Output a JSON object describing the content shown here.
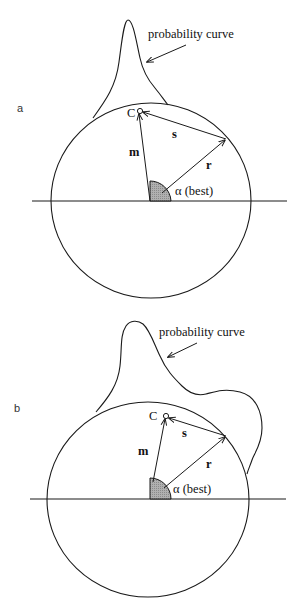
{
  "panels": [
    {
      "label": "a",
      "curve_label": "probability curve",
      "point_label": "C",
      "vector_m": "m",
      "vector_s": "s",
      "vector_r": "r",
      "angle_label": "α (best)"
    },
    {
      "label": "b",
      "curve_label": "probability curve",
      "point_label": "C",
      "vector_m": "m",
      "vector_s": "s",
      "vector_r": "r",
      "angle_label": "α (best)"
    }
  ],
  "colors": {
    "line": "#1a1a1a",
    "wedge_fill": "#a8a8a8",
    "background": "#ffffff"
  }
}
